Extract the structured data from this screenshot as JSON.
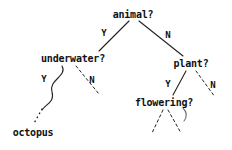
{
  "diagram": {
    "type": "decision-tree",
    "background_color": "#ffffff",
    "stroke_color": "#222222",
    "text_color": "#111111"
  },
  "nodes": [
    {
      "id": "animal",
      "label": "animal?",
      "x": 133,
      "y": 14,
      "kind": "question"
    },
    {
      "id": "underwater",
      "label": "underwater?",
      "x": 73,
      "y": 58,
      "kind": "question"
    },
    {
      "id": "plant",
      "label": "plant?",
      "x": 191,
      "y": 63,
      "kind": "question"
    },
    {
      "id": "flowering",
      "label": "flowering?",
      "x": 164,
      "y": 102,
      "kind": "question"
    },
    {
      "id": "octopus",
      "label": "octopus",
      "x": 33,
      "y": 132,
      "kind": "leaf"
    }
  ],
  "edge_labels": [
    {
      "id": "animal-yes",
      "label": "Y",
      "x": 104,
      "y": 33
    },
    {
      "id": "animal-no",
      "label": "N",
      "x": 168,
      "y": 35
    },
    {
      "id": "underwater-yes",
      "label": "Y",
      "x": 44,
      "y": 79
    },
    {
      "id": "underwater-no",
      "label": "N",
      "x": 92,
      "y": 80
    },
    {
      "id": "plant-yes",
      "label": "Y",
      "x": 168,
      "y": 84
    },
    {
      "id": "plant-no",
      "label": "N",
      "x": 213,
      "y": 85
    }
  ],
  "edges": [
    {
      "id": "animal-to-underwater",
      "from": "animal",
      "to": "underwater",
      "style": "solid",
      "branch": "Y"
    },
    {
      "id": "animal-to-plant",
      "from": "animal",
      "to": "plant",
      "style": "solid",
      "branch": "N"
    },
    {
      "id": "underwater-to-wave",
      "from": "underwater",
      "to": "octopus-curve",
      "style": "curved-solid",
      "branch": "Y"
    },
    {
      "id": "wave-to-octopus",
      "from": "octopus-curve",
      "to": "octopus",
      "style": "dotted",
      "branch": ""
    },
    {
      "id": "underwater-to-none",
      "from": "underwater",
      "to": "",
      "style": "dashed",
      "branch": "N"
    },
    {
      "id": "plant-to-flowering",
      "from": "plant",
      "to": "flowering",
      "style": "solid",
      "branch": "Y"
    },
    {
      "id": "plant-to-none",
      "from": "plant",
      "to": "",
      "style": "dashed",
      "branch": "N"
    },
    {
      "id": "flowering-to-left",
      "from": "flowering",
      "to": "",
      "style": "dashed",
      "branch": ""
    },
    {
      "id": "flowering-to-right",
      "from": "flowering",
      "to": "",
      "style": "dashed",
      "branch": ""
    }
  ]
}
